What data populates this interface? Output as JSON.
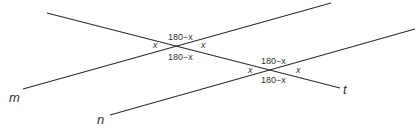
{
  "diagram": {
    "lines": [
      {
        "id": "t",
        "label": "t",
        "x1": 47,
        "y1": 13,
        "x2": 340,
        "y2": 88
      },
      {
        "id": "m",
        "label": "m",
        "x1": 23,
        "y1": 89,
        "x2": 331,
        "y2": 3
      },
      {
        "id": "n",
        "label": "n",
        "x1": 110,
        "y1": 115,
        "x2": 415,
        "y2": 29
      }
    ],
    "line_labels": {
      "t": "t",
      "m": "m",
      "n": "n"
    },
    "intersection_1": {
      "lines": [
        "t",
        "m"
      ],
      "top": "180−x",
      "left": "x",
      "right": "x",
      "bottom": "180−x"
    },
    "intersection_2": {
      "lines": [
        "t",
        "n"
      ],
      "top": "180−x",
      "left": "x",
      "right": "x",
      "bottom": "180−x"
    },
    "colors": {
      "line": "#2b2b2b",
      "text": "#333333",
      "background": "#ffffff"
    }
  }
}
